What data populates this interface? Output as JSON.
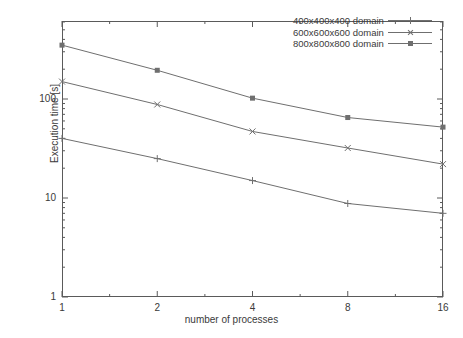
{
  "chart_data": {
    "type": "line",
    "title": "",
    "xlabel": "number of processes",
    "ylabel": "Execution time [s]",
    "xscale": "log2",
    "yscale": "log10",
    "x": [
      1,
      2,
      4,
      8,
      16
    ],
    "xticklabels": [
      "1",
      "2",
      "4",
      "8",
      "16"
    ],
    "yticklabels": [
      "1",
      "10",
      "100"
    ],
    "ytickvalues": [
      1,
      10,
      100
    ],
    "xlim": [
      1,
      16
    ],
    "ylim": [
      1,
      1000
    ],
    "grid": false,
    "legend_position": "top-right-inside",
    "series": [
      {
        "name": "400x400x400 domain",
        "marker": "plus",
        "color": "#6f6f6f",
        "values": [
          40,
          25,
          15,
          8.8,
          7.0
        ]
      },
      {
        "name": "600x600x600 domain",
        "marker": "cross",
        "color": "#6f6f6f",
        "values": [
          150,
          88,
          47,
          32,
          22
        ]
      },
      {
        "name": "800x800x800 domain",
        "marker": "box",
        "color": "#6f6f6f",
        "values": [
          350,
          195,
          102,
          65,
          52
        ]
      }
    ]
  },
  "axes": {
    "y_title": "Execution time [s]",
    "x_title": "number of processes"
  }
}
